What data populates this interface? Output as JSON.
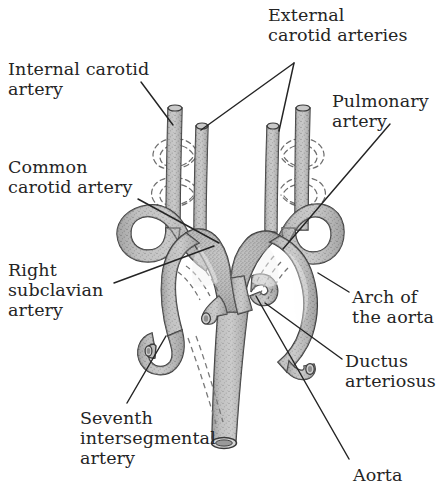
{
  "figure": {
    "width": 438,
    "height": 504,
    "background": "#ffffff",
    "ink_color": "#242424",
    "vessel_fill": "#b9b9b9",
    "vessel_fill_light": "#cfcfcf",
    "vessel_outline": "#3a3a3a",
    "stipple_color": "#4a4a4a",
    "dashed_remnant_color": "#6d6d6d"
  },
  "labels": [
    {
      "id": "external-carotid-arteries",
      "text": "External\ncarotid arteries",
      "x": 268,
      "y": 6,
      "align": "left"
    },
    {
      "id": "internal-carotid-artery",
      "text": "Internal carotid\nartery",
      "x": 8,
      "y": 60,
      "align": "left"
    },
    {
      "id": "pulmonary-artery",
      "text": "Pulmonary\nartery",
      "x": 332,
      "y": 92,
      "align": "left"
    },
    {
      "id": "common-carotid-artery",
      "text": "Common\ncarotid artery",
      "x": 8,
      "y": 158,
      "align": "left"
    },
    {
      "id": "right-subclavian-artery",
      "text": "Right\nsubclavian\nartery",
      "x": 8,
      "y": 261,
      "align": "left"
    },
    {
      "id": "arch-of-the-aorta",
      "text": "Arch of\nthe aorta",
      "x": 352,
      "y": 288,
      "align": "left"
    },
    {
      "id": "ductus-arteriosus",
      "text": "Ductus\narteriosus",
      "x": 345,
      "y": 352,
      "align": "left"
    },
    {
      "id": "seventh-intersegmental-artery",
      "text": "Seventh\nintersegmental\nartery",
      "x": 80,
      "y": 409,
      "align": "left"
    },
    {
      "id": "aorta",
      "text": "Aorta",
      "x": 353,
      "y": 466,
      "align": "left"
    }
  ],
  "leader_lines": [
    {
      "id": "leader-external-carotid-right",
      "points": "294,63 201,130"
    },
    {
      "id": "leader-external-carotid-left",
      "points": "294,63 279,131"
    },
    {
      "id": "leader-internal-carotid",
      "points": "141,82 173,125"
    },
    {
      "id": "leader-pulmonary-artery",
      "points": "390,124 283,249"
    },
    {
      "id": "leader-common-carotid",
      "points": "138,199 219,243"
    },
    {
      "id": "leader-right-subclavian",
      "points": "114,283 214,246"
    },
    {
      "id": "leader-arch-of-aorta",
      "points": "349,292 318,273"
    },
    {
      "id": "leader-ductus-arteriosus",
      "points": "342,359 265,303"
    },
    {
      "id": "leader-seventh-intersegmental",
      "points": "127,403 166,336"
    },
    {
      "id": "leader-aorta",
      "points": "349,459 256,296"
    }
  ],
  "anatomy": {
    "structures": [
      {
        "id": "right-internal-carotid",
        "name": "Right internal carotid artery",
        "side": "right"
      },
      {
        "id": "right-external-carotid",
        "name": "Right external carotid artery",
        "side": "right"
      },
      {
        "id": "left-internal-carotid",
        "name": "Left internal carotid artery",
        "side": "left"
      },
      {
        "id": "left-external-carotid",
        "name": "Left external carotid artery",
        "side": "left"
      },
      {
        "id": "right-common-carotid",
        "name": "Right common carotid artery",
        "side": "right"
      },
      {
        "id": "left-common-carotid",
        "name": "Left common carotid artery",
        "side": "left"
      },
      {
        "id": "right-subclavian",
        "name": "Right subclavian artery",
        "side": "right"
      },
      {
        "id": "left-subclavian",
        "name": "Left subclavian artery",
        "side": "left"
      },
      {
        "id": "aortic-arch",
        "name": "Arch of the aorta",
        "side": "center"
      },
      {
        "id": "ductus-arteriosus",
        "name": "Ductus arteriosus",
        "side": "left"
      },
      {
        "id": "pulmonary-artery",
        "name": "Pulmonary artery",
        "side": "center"
      },
      {
        "id": "descending-aorta",
        "name": "Aorta (descending)",
        "side": "center"
      },
      {
        "id": "seventh-intersegmental",
        "name": "Seventh intersegmental artery",
        "side": "right"
      }
    ],
    "regressed_remnants": {
      "style": "dashed outline",
      "count": 4,
      "description": "Dashed loops marking regressed aortic arch segments"
    }
  }
}
